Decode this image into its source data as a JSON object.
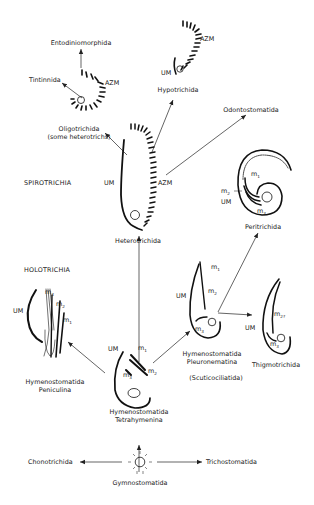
{
  "figure": {
    "type": "phylogeny-diagram"
  },
  "groups": {
    "spirotrichia": "SPIROTRICHIA",
    "holotrichia": "HOLOTRICHIA"
  },
  "taxa": {
    "entodiniomorphida": "Entodiniomorphida",
    "tintinnida": "Tintinnida",
    "oligotrichida": "Oligotrichida",
    "oligotrichida_note": "(some heterotrichs)",
    "hypotrichida": "Hypotrichida",
    "odontostomatida": "Odontostomatida",
    "heterotrichida": "Heterotrichida",
    "peritrichida": "Peritrichida",
    "peniculina_line1": "Hymenostomatida",
    "peniculina_line2": "Peniculina",
    "tetrahymenina_line1": "Hymenostomatida",
    "tetrahymenina_line2": "Tetrahymenina",
    "pleuronematina_line1": "Hymenostomatida",
    "pleuronematina_line2": "Pleuronematina",
    "scuticociliatida": "(Scuticociliatida)",
    "thigmotrichida": "Thigmotrichida",
    "chonotrichida": "Chonotrichida",
    "gymnostomatida": "Gymnostomatida",
    "trichostomatida": "Trichostomatida"
  },
  "structure_labels": {
    "azm": "AZM",
    "um": "UM",
    "m": "m",
    "m1_sub": "1",
    "m2_sub": "2",
    "m3_sub": "3",
    "m2q_sub": "2?"
  }
}
